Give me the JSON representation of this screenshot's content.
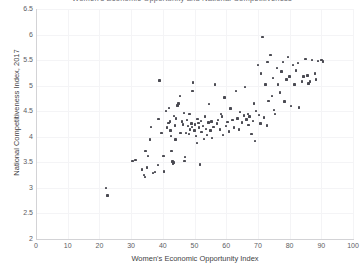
{
  "chart_data": {
    "type": "scatter",
    "title": "Women's Economic Opportunity and National Competitiveness",
    "xlabel": "Women's Economic Opportunity Index",
    "ylabel": "National Competitiveness Index, 2017",
    "xlim": [
      0,
      100
    ],
    "ylim": [
      2,
      6.5
    ],
    "xticks": [
      0,
      10,
      20,
      30,
      40,
      50,
      60,
      70,
      80,
      90,
      100
    ],
    "yticks": [
      2,
      2.5,
      3,
      3.5,
      4,
      4.5,
      5,
      5.5,
      6,
      6.5
    ],
    "grid": true,
    "legend": "none",
    "marker_color": "#4a4a52",
    "points": [
      [
        22.0,
        3.0
      ],
      [
        22.6,
        2.85
      ],
      [
        30.5,
        3.53
      ],
      [
        31.4,
        3.55
      ],
      [
        33.4,
        3.36
      ],
      [
        34.0,
        3.25
      ],
      [
        34.4,
        3.21
      ],
      [
        34.6,
        3.72
      ],
      [
        35.0,
        3.4
      ],
      [
        35.4,
        3.62
      ],
      [
        36.0,
        3.95
      ],
      [
        36.2,
        4.19
      ],
      [
        37.0,
        3.29
      ],
      [
        37.6,
        3.31
      ],
      [
        38.4,
        3.45
      ],
      [
        38.6,
        4.35
      ],
      [
        39.0,
        5.1
      ],
      [
        39.6,
        4.07
      ],
      [
        40.2,
        3.63
      ],
      [
        40.4,
        3.32
      ],
      [
        41.0,
        4.5
      ],
      [
        41.4,
        4.18
      ],
      [
        41.8,
        4.27
      ],
      [
        42.0,
        4.56
      ],
      [
        42.2,
        4.3
      ],
      [
        42.4,
        4.12
      ],
      [
        42.6,
        4.02
      ],
      [
        42.8,
        3.72
      ],
      [
        43.0,
        3.52
      ],
      [
        43.2,
        3.47
      ],
      [
        43.4,
        3.5
      ],
      [
        43.6,
        4.41
      ],
      [
        43.8,
        4.22
      ],
      [
        44.0,
        3.95
      ],
      [
        44.2,
        4.36
      ],
      [
        44.6,
        4.61
      ],
      [
        45.0,
        4.65
      ],
      [
        45.4,
        4.8
      ],
      [
        45.6,
        4.08
      ],
      [
        46.0,
        4.3
      ],
      [
        46.4,
        4.24
      ],
      [
        46.6,
        4.46
      ],
      [
        46.8,
        3.53
      ],
      [
        47.0,
        3.6
      ],
      [
        47.4,
        4.08
      ],
      [
        47.6,
        4.33
      ],
      [
        48.0,
        4.21
      ],
      [
        48.2,
        4.05
      ],
      [
        48.4,
        4.44
      ],
      [
        48.6,
        4.14
      ],
      [
        49.0,
        4.26
      ],
      [
        49.2,
        4.19
      ],
      [
        49.4,
        4.9
      ],
      [
        49.6,
        5.06
      ],
      [
        50.0,
        4.12
      ],
      [
        50.2,
        4.24
      ],
      [
        50.4,
        4.02
      ],
      [
        50.8,
        3.88
      ],
      [
        51.0,
        4.35
      ],
      [
        51.2,
        4.27
      ],
      [
        51.4,
        4.18
      ],
      [
        51.8,
        3.46
      ],
      [
        52.0,
        4.31
      ],
      [
        52.2,
        4.09
      ],
      [
        52.6,
        4.21
      ],
      [
        53.0,
        3.96
      ],
      [
        53.4,
        4.4
      ],
      [
        53.6,
        4.15
      ],
      [
        54.0,
        4.03
      ],
      [
        54.4,
        4.28
      ],
      [
        54.6,
        4.64
      ],
      [
        55.0,
        4.12
      ],
      [
        55.4,
        4.3
      ],
      [
        55.6,
        3.98
      ],
      [
        56.0,
        4.19
      ],
      [
        56.4,
        5.02
      ],
      [
        57.0,
        4.26
      ],
      [
        57.4,
        4.33
      ],
      [
        58.0,
        4.14
      ],
      [
        58.4,
        4.44
      ],
      [
        58.6,
        4.4
      ],
      [
        59.0,
        4.04
      ],
      [
        59.4,
        4.77
      ],
      [
        60.0,
        4.21
      ],
      [
        60.4,
        4.29
      ],
      [
        60.8,
        4.1
      ],
      [
        61.4,
        4.55
      ],
      [
        62.0,
        4.33
      ],
      [
        62.4,
        4.18
      ],
      [
        63.0,
        4.9
      ],
      [
        63.6,
        4.36
      ],
      [
        64.0,
        4.14
      ],
      [
        64.4,
        4.48
      ],
      [
        65.0,
        4.28
      ],
      [
        65.6,
        4.42
      ],
      [
        66.0,
        4.98
      ],
      [
        66.4,
        4.34
      ],
      [
        66.8,
        4.45
      ],
      [
        67.0,
        4.23
      ],
      [
        67.4,
        4.4
      ],
      [
        68.0,
        4.06
      ],
      [
        68.4,
        4.31
      ],
      [
        68.8,
        4.65
      ],
      [
        69.0,
        3.92
      ],
      [
        69.4,
        4.5
      ],
      [
        70.0,
        5.4
      ],
      [
        70.4,
        4.43
      ],
      [
        70.8,
        4.26
      ],
      [
        71.0,
        5.24
      ],
      [
        71.4,
        5.95
      ],
      [
        72.0,
        4.38
      ],
      [
        72.4,
        5.02
      ],
      [
        72.8,
        4.22
      ],
      [
        73.0,
        5.46
      ],
      [
        73.4,
        4.7
      ],
      [
        74.0,
        5.6
      ],
      [
        74.4,
        4.8
      ],
      [
        74.8,
        5.15
      ],
      [
        75.0,
        4.52
      ],
      [
        75.4,
        4.44
      ],
      [
        76.0,
        5.34
      ],
      [
        76.4,
        5.02
      ],
      [
        77.0,
        4.87
      ],
      [
        77.4,
        5.28
      ],
      [
        78.0,
        5.46
      ],
      [
        78.4,
        4.69
      ],
      [
        79.0,
        5.12
      ],
      [
        79.4,
        5.56
      ],
      [
        80.0,
        5.18
      ],
      [
        80.4,
        4.6
      ],
      [
        81.0,
        5.4
      ],
      [
        81.6,
        5.02
      ],
      [
        82.0,
        5.3
      ],
      [
        82.6,
        5.44
      ],
      [
        83.0,
        4.57
      ],
      [
        84.0,
        5.08
      ],
      [
        84.4,
        5.18
      ],
      [
        85.0,
        5.52
      ],
      [
        85.6,
        5.2
      ],
      [
        86.0,
        5.04
      ],
      [
        86.4,
        5.08
      ],
      [
        87.0,
        5.5
      ],
      [
        88.0,
        5.24
      ],
      [
        88.4,
        5.12
      ],
      [
        89.0,
        5.48
      ],
      [
        90.0,
        5.5
      ],
      [
        90.6,
        5.47
      ]
    ]
  },
  "axes": {
    "x_tick_labels": [
      "0",
      "10",
      "20",
      "30",
      "40",
      "50",
      "60",
      "70",
      "80",
      "90",
      "100"
    ],
    "y_tick_labels": [
      "2",
      "2.5",
      "3",
      "3.5",
      "4",
      "4.5",
      "5",
      "5.5",
      "6",
      "6.5"
    ],
    "x_title": "Women's Economic Opportunity Index",
    "y_title": "National Competitiveness Index, 2017"
  }
}
